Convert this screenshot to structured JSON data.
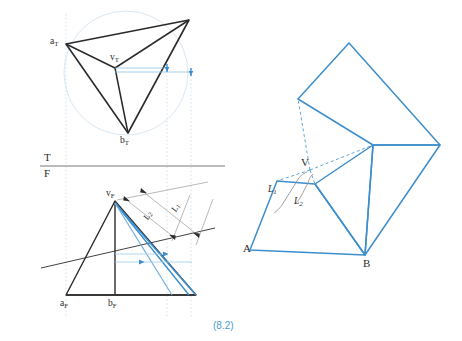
{
  "figure": {
    "caption": "(8.2)",
    "caption_color": "#4a9ad4",
    "stroke_dark": "#2b2b2b",
    "stroke_blue": "#3d8ecc",
    "stroke_light_blue": "#bcd9ee",
    "stroke_gray": "#9a9a9a"
  },
  "orthographic": {
    "plane_labels": {
      "top": "T",
      "front": "F"
    },
    "top_view": {
      "vertex_apex": "v",
      "vertex_apex_sub": "T",
      "vertex_a": "a",
      "vertex_a_sub": "T",
      "vertex_b": "b",
      "vertex_b_sub": "T",
      "apex_label": "vT",
      "a_label": "aT",
      "b_label": "bT"
    },
    "front_view": {
      "vertex_apex": "v",
      "vertex_apex_sub": "F",
      "vertex_a": "a",
      "vertex_a_sub": "F",
      "vertex_b": "b",
      "vertex_b_sub": "F",
      "apex_label": "vF",
      "a_label": "aF",
      "b_label": "bF",
      "dimension_1": "L",
      "dimension_1_sub": "1",
      "dimension_2": "L",
      "dimension_2_sub": "2"
    }
  },
  "pictorial": {
    "vertex_v": "V",
    "vertex_a": "A",
    "vertex_b": "B",
    "dimension_1": "L",
    "dimension_1_sub": "1",
    "dimension_2": "L",
    "dimension_2_sub": "2"
  }
}
